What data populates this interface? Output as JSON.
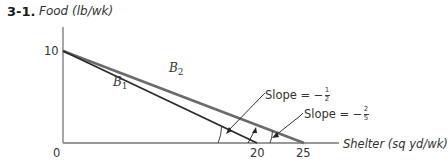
{
  "figure": {
    "number": "3-1.",
    "y_axis_label": "Food (lb/wk)",
    "x_axis_label": "Shelter (sq yd/wk)"
  },
  "ticks": {
    "origin": "0",
    "y_intercept": "10",
    "x_b1": "20",
    "x_b2": "25"
  },
  "lines": [
    {
      "id": "B1",
      "name": "B",
      "sub": "1",
      "y_intercept": 10,
      "x_intercept": 20,
      "color": "#222222"
    },
    {
      "id": "B2",
      "name": "B",
      "sub": "2",
      "y_intercept": 10,
      "x_intercept": 25,
      "color": "#555555"
    }
  ],
  "annotations": {
    "slope1": {
      "prefix": "Slope = −",
      "num": "1",
      "den": "2"
    },
    "slope2": {
      "prefix": "Slope = −",
      "num": "2",
      "den": "5"
    }
  }
}
